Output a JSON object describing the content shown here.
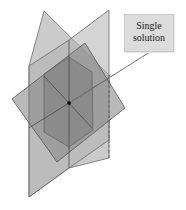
{
  "figure": {
    "callout": {
      "line1": "Single",
      "line2": "solution"
    },
    "colors": {
      "plane_light": "#b4b4b4",
      "plane_mid": "#8c8c8c",
      "edge": "#5a5a5a",
      "point": "#000000",
      "callout_bg": "#dcdcdc"
    },
    "intersection_point": {
      "x": 69,
      "y": 103
    }
  }
}
